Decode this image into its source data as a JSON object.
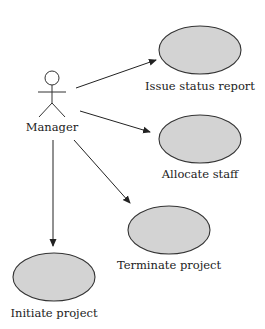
{
  "diagram": {
    "type": "uml-use-case",
    "colors": {
      "usecase_fill": "#d3d3d3",
      "stroke": "#333333",
      "text": "#222222",
      "background": "#ffffff"
    },
    "actor": {
      "name": "Manager",
      "x": 52,
      "y": 78
    },
    "use_cases": [
      {
        "id": "uc1",
        "label": "Issue status report",
        "cx": 200,
        "cy": 50,
        "rx": 41,
        "ry": 24,
        "label_x": 200,
        "label_y": 90
      },
      {
        "id": "uc2",
        "label": "Allocate staff",
        "cx": 200,
        "cy": 139,
        "rx": 41,
        "ry": 24,
        "label_x": 200,
        "label_y": 178
      },
      {
        "id": "uc3",
        "label": "Terminate project",
        "cx": 169,
        "cy": 230,
        "rx": 41,
        "ry": 24,
        "label_x": 169,
        "label_y": 269
      },
      {
        "id": "uc4",
        "label": "Initiate project",
        "cx": 54,
        "cy": 277,
        "rx": 41,
        "ry": 24,
        "label_x": 54,
        "label_y": 317
      }
    ],
    "associations": [
      {
        "from": "Manager",
        "to": "Issue status report",
        "x1": 76,
        "y1": 88,
        "x2": 156,
        "y2": 60
      },
      {
        "from": "Manager",
        "to": "Allocate staff",
        "x1": 80,
        "y1": 111,
        "x2": 150,
        "y2": 132
      },
      {
        "from": "Manager",
        "to": "Terminate project",
        "x1": 74,
        "y1": 140,
        "x2": 130,
        "y2": 203
      },
      {
        "from": "Manager",
        "to": "Initiate project",
        "x1": 53,
        "y1": 140,
        "x2": 53,
        "y2": 246
      }
    ]
  }
}
